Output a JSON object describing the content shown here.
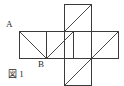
{
  "figure": {
    "caption": "図 1",
    "stroke_color": "#3a3a3a",
    "diagonal_color": "#4a4a4a",
    "background_color": "#ffffff",
    "stroke_width": 1,
    "cell_size": 27,
    "origin_x": 19,
    "origin_y": 4,
    "labels": [
      {
        "id": "A",
        "text": "A",
        "cell": "row1-col1",
        "corner": "top-left"
      },
      {
        "id": "B",
        "text": "B",
        "cell": "row1-col1",
        "corner": "bottom-right"
      }
    ],
    "squares": [
      {
        "id": "top",
        "row": 0,
        "col": 2,
        "x": 64,
        "y": 4,
        "w": 27,
        "h": 27,
        "diagonal": "bottom-left-to-top-right"
      },
      {
        "id": "mid-1",
        "row": 1,
        "col": 0,
        "x": 19,
        "y": 31,
        "w": 27,
        "h": 27,
        "diagonal": "top-left-to-bottom-right"
      },
      {
        "id": "mid-2",
        "row": 1,
        "col": 1,
        "x": 46,
        "y": 31,
        "w": 27,
        "h": 27,
        "diagonal": "bottom-left-to-top-right"
      },
      {
        "id": "mid-3",
        "row": 1,
        "col": 2,
        "x": 64,
        "y": 31,
        "w": 27,
        "h": 27,
        "diagonal": "none"
      },
      {
        "id": "mid-4",
        "row": 1,
        "col": 3,
        "x": 91,
        "y": 31,
        "w": 27,
        "h": 27,
        "diagonal": "bottom-left-to-top-right"
      },
      {
        "id": "bottom",
        "row": 2,
        "col": 2,
        "x": 64,
        "y": 58,
        "w": 27,
        "h": 27,
        "diagonal": "bottom-left-to-top-right"
      }
    ]
  }
}
